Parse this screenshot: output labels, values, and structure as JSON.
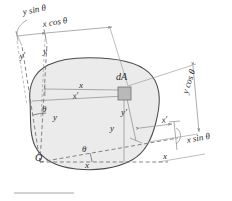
{
  "figure": {
    "type": "engineering-diagram",
    "colors": {
      "area_fill": "#ebebeb",
      "outline": "#4a4a4a",
      "dimension_line": "#808080",
      "axis_line": "#707070",
      "element_fill": "#b9b9b9",
      "text": "#2a2a2a"
    },
    "labels": [
      {
        "id": "y-sin-theta",
        "text": "y sin θ",
        "x": 22,
        "y": 13,
        "rotate": -11,
        "size": 9
      },
      {
        "id": "x-cos-theta",
        "text": "x cos θ",
        "x": 42,
        "y": 25,
        "rotate": -9,
        "size": 9
      },
      {
        "id": "y-prime-left",
        "text": "y′",
        "x": 19,
        "y": 57,
        "rotate": -9,
        "size": 9
      },
      {
        "id": "y-top-left",
        "text": "y",
        "x": 43,
        "y": 52,
        "rotate": 0,
        "size": 9
      },
      {
        "id": "dA",
        "text": "dA",
        "x": 116,
        "y": 78,
        "rotate": 0,
        "size": 10
      },
      {
        "id": "x-center",
        "text": "x",
        "x": 79,
        "y": 86,
        "rotate": 0,
        "size": 9
      },
      {
        "id": "x-prime-center",
        "text": "x′",
        "x": 72,
        "y": 97,
        "rotate": -9,
        "size": 9
      },
      {
        "id": "theta-left",
        "text": "θ",
        "x": 42,
        "y": 110,
        "rotate": 0,
        "size": 9
      },
      {
        "id": "y-left",
        "text": "y",
        "x": 53,
        "y": 118,
        "rotate": 0,
        "size": 9
      },
      {
        "id": "y-prime-mid",
        "text": "y′",
        "x": 121,
        "y": 113,
        "rotate": 0,
        "size": 9
      },
      {
        "id": "y-mid",
        "text": "y",
        "x": 110,
        "y": 129,
        "rotate": 0,
        "size": 9
      },
      {
        "id": "y-cos-theta",
        "text": "y cos θ",
        "x": 181,
        "y": 92,
        "rotate": -72,
        "size": 9
      },
      {
        "id": "x-prime-right",
        "text": "x′",
        "x": 161,
        "y": 121,
        "rotate": -9,
        "size": 9
      },
      {
        "id": "x-sin-theta",
        "text": "x sin θ",
        "x": 186,
        "y": 140,
        "rotate": -10,
        "size": 9
      },
      {
        "id": "origin-O",
        "text": "O",
        "x": 35,
        "y": 158,
        "rotate": 0,
        "size": 10
      },
      {
        "id": "theta-bottom",
        "text": "θ",
        "x": 82,
        "y": 150,
        "rotate": 0,
        "size": 9
      },
      {
        "id": "x-bottom",
        "text": "x",
        "x": 85,
        "y": 166,
        "rotate": 0,
        "size": 9
      },
      {
        "id": "x-axis-right",
        "text": "x",
        "x": 163,
        "y": 157,
        "rotate": 0,
        "size": 9
      }
    ]
  }
}
